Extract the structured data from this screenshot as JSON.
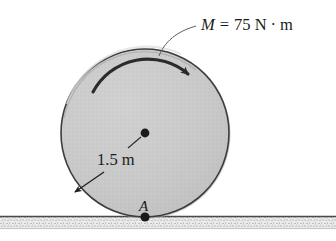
{
  "figure": {
    "background_color": "#ffffff",
    "labels": {
      "moment_symbol": "M",
      "moment_equals": "=",
      "moment_value": "75 N",
      "moment_dot": "·",
      "moment_unit": "m",
      "moment_full": "M = 75 N · m",
      "radius": "1.5 m",
      "contact_point": "A"
    },
    "disk": {
      "center_x": 145,
      "center_y": 133,
      "radius_px": 84,
      "fill_color": "#c8c8c8",
      "edge_color": "#3c3c3c",
      "center_dot_color": "#1a1a1a",
      "radius_value": 1.5,
      "radius_unit": "m"
    },
    "moment_arrow": {
      "direction": "clockwise",
      "magnitude": 75,
      "unit": "N · m",
      "color": "#2b2b2b"
    },
    "ground": {
      "line_y": 216,
      "line_color": "#4a4a4a",
      "hatch_fill": "#e8e8e8",
      "speckle_color": "#8a8a8a"
    },
    "contact": {
      "label": "A",
      "x": 145,
      "y": 217,
      "dot_color": "#1a1a1a"
    }
  }
}
